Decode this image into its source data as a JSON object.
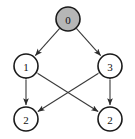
{
  "diagram": {
    "background_color": "#ffffff",
    "edge_color": "#3a3a3a",
    "node_border_color": "#1a1a1a",
    "node_fill_default": "#ffffff",
    "node_fill_highlight": "#b6b6b6",
    "nodes": [
      {
        "id": "n0",
        "label": "0",
        "cx": 68,
        "cy": 19,
        "r": 12,
        "highlight": true
      },
      {
        "id": "n1",
        "label": "1",
        "cx": 26,
        "cy": 66,
        "r": 12,
        "highlight": false
      },
      {
        "id": "n3",
        "label": "3",
        "cx": 110,
        "cy": 66,
        "r": 12,
        "highlight": false
      },
      {
        "id": "n2a",
        "label": "2",
        "cx": 26,
        "cy": 119,
        "r": 12,
        "highlight": false
      },
      {
        "id": "n2b",
        "label": "2",
        "cx": 110,
        "cy": 119,
        "r": 12,
        "highlight": false
      }
    ],
    "edges": [
      {
        "from": "n0",
        "to": "n1",
        "arrow_at_target": true,
        "arrow_at_source": false
      },
      {
        "from": "n0",
        "to": "n3",
        "arrow_at_target": true,
        "arrow_at_source": false
      },
      {
        "from": "n1",
        "to": "n2a",
        "arrow_at_target": true,
        "arrow_at_source": true
      },
      {
        "from": "n3",
        "to": "n2b",
        "arrow_at_target": true,
        "arrow_at_source": true
      },
      {
        "from": "n1",
        "to": "n2b",
        "arrow_at_target": true,
        "arrow_at_source": true
      },
      {
        "from": "n3",
        "to": "n2a",
        "arrow_at_target": true,
        "arrow_at_source": true
      }
    ]
  }
}
